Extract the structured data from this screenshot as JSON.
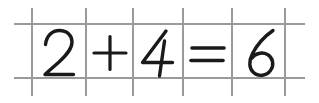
{
  "worksheet": {
    "title": "handwritten-arithmetic-worksheet",
    "background_color": "#ffffff",
    "width": 319,
    "height": 103,
    "equation_text": "2 + 4 = 6",
    "expression": {
      "left_operand": "2",
      "operator": "+",
      "right_operand": "4",
      "equals_sign": "=",
      "result": "6"
    }
  },
  "grid": {
    "line_color": "#9a9a9a",
    "line_width": 1.6,
    "vertical_lines_x": [
      32,
      86,
      133,
      183,
      232,
      285
    ],
    "vertical_line_top": 8,
    "vertical_line_bottom": 96,
    "horizontal_lines_y": [
      24,
      78
    ],
    "horizontal_line_left": 14,
    "horizontal_line_right": 305
  },
  "cells": [
    {
      "index": 0,
      "name": "cell-left-operand",
      "content": "2",
      "kind": "digit",
      "x": 32,
      "width": 54,
      "ink_color": "#1a1a1a"
    },
    {
      "index": 1,
      "name": "cell-operator-plus",
      "content": "+",
      "kind": "operator",
      "x": 86,
      "width": 47,
      "ink_color": "#1a1a1a"
    },
    {
      "index": 2,
      "name": "cell-right-operand",
      "content": "4",
      "kind": "digit",
      "x": 133,
      "width": 50,
      "ink_color": "#1a1a1a"
    },
    {
      "index": 3,
      "name": "cell-operator-equals",
      "content": "=",
      "kind": "operator",
      "x": 183,
      "width": 49,
      "ink_color": "#1a1a1a"
    },
    {
      "index": 4,
      "name": "cell-result",
      "content": "6",
      "kind": "digit",
      "x": 232,
      "width": 53,
      "ink_color": "#1a1a1a"
    }
  ]
}
